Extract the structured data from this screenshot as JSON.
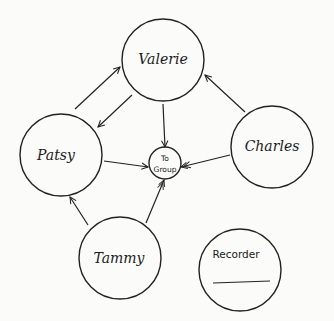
{
  "diagram": {
    "type": "sociogram",
    "background": "#fbfbfa",
    "stroke_color": "#222222",
    "nodes": [
      {
        "id": "valerie",
        "label": "Valerie",
        "cx": 163,
        "cy": 60,
        "r": 41,
        "style": "script"
      },
      {
        "id": "patsy",
        "label": "Patsy",
        "cx": 61,
        "cy": 155,
        "r": 41,
        "style": "script"
      },
      {
        "id": "charles",
        "label": "Charles",
        "cx": 272,
        "cy": 147,
        "r": 41,
        "style": "script"
      },
      {
        "id": "to_group",
        "label_line1": "To",
        "label_line2": "Group",
        "cx": 165,
        "cy": 163,
        "r": 16,
        "style": "print"
      },
      {
        "id": "tammy",
        "label": "Tammy",
        "cx": 120,
        "cy": 258,
        "r": 41,
        "style": "script"
      },
      {
        "id": "recorder",
        "label": "Recorder",
        "cx": 240,
        "cy": 270,
        "r": 41,
        "style": "print"
      }
    ],
    "edges": [
      {
        "from": "patsy",
        "to": "valerie",
        "heads": 1
      },
      {
        "from": "valerie",
        "to": "patsy",
        "heads": 1
      },
      {
        "from": "valerie",
        "to": "to_group",
        "heads": 1
      },
      {
        "from": "charles",
        "to": "valerie",
        "heads": 1
      },
      {
        "from": "charles",
        "to": "to_group",
        "heads": 2
      },
      {
        "from": "patsy",
        "to": "to_group",
        "heads": 1
      },
      {
        "from": "tammy",
        "to": "patsy",
        "heads": 1
      },
      {
        "from": "tammy",
        "to": "to_group",
        "heads": 2
      }
    ]
  }
}
